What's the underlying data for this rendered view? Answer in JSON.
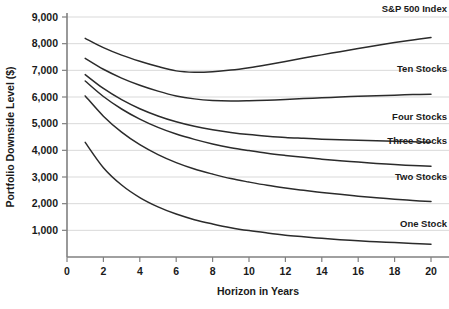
{
  "chart_data": {
    "type": "line",
    "title": "",
    "xlabel": "Horizon in Years",
    "ylabel": "Portfolio Downside Level ($)",
    "xlim": [
      0,
      20
    ],
    "ylim": [
      0,
      9000
    ],
    "grid": true,
    "legend_position": "inline-right",
    "x_ticks": [
      "0",
      "2",
      "4",
      "6",
      "8",
      "10",
      "12",
      "14",
      "16",
      "18",
      "20"
    ],
    "x_tick_values": [
      0,
      2,
      4,
      6,
      8,
      10,
      12,
      14,
      16,
      18,
      20
    ],
    "y_ticks": [
      "1,000",
      "2,000",
      "3,000",
      "4,000",
      "5,000",
      "6,000",
      "7,000",
      "8,000",
      "9,000"
    ],
    "y_tick_values": [
      1000,
      2000,
      3000,
      4000,
      5000,
      6000,
      7000,
      8000,
      9000
    ],
    "x": [
      1,
      2,
      3,
      4,
      5,
      6,
      7,
      8,
      9,
      10,
      11,
      12,
      13,
      14,
      15,
      16,
      17,
      18,
      19,
      20
    ],
    "series": [
      {
        "name": "S&P 500 Index",
        "label": "S&P 500 Index",
        "values": [
          8200,
          7850,
          7570,
          7340,
          7140,
          6980,
          6930,
          6950,
          7010,
          7100,
          7210,
          7330,
          7460,
          7580,
          7700,
          7820,
          7930,
          8040,
          8140,
          8230
        ]
      },
      {
        "name": "Ten Stocks",
        "label": "Ten Stocks",
        "values": [
          7450,
          7040,
          6710,
          6440,
          6220,
          6040,
          5930,
          5870,
          5850,
          5860,
          5880,
          5910,
          5940,
          5970,
          6000,
          6030,
          6050,
          6070,
          6090,
          6100
        ]
      },
      {
        "name": "Four Stocks",
        "label": "Four Stocks",
        "values": [
          6840,
          6320,
          5900,
          5560,
          5290,
          5070,
          4900,
          4770,
          4670,
          4590,
          4530,
          4480,
          4450,
          4420,
          4400,
          4380,
          4360,
          4340,
          4320,
          4300
        ]
      },
      {
        "name": "Three Stocks",
        "label": "Three Stocks",
        "values": [
          6600,
          6020,
          5550,
          5170,
          4860,
          4610,
          4410,
          4240,
          4100,
          3990,
          3890,
          3810,
          3740,
          3670,
          3610,
          3560,
          3510,
          3470,
          3430,
          3400
        ]
      },
      {
        "name": "Two Stocks",
        "label": "Two Stocks",
        "values": [
          6040,
          5280,
          4680,
          4210,
          3840,
          3540,
          3300,
          3110,
          2940,
          2810,
          2690,
          2590,
          2500,
          2420,
          2350,
          2280,
          2220,
          2170,
          2120,
          2080
        ]
      },
      {
        "name": "One Stock",
        "label": "One Stock",
        "values": [
          4300,
          3350,
          2700,
          2230,
          1880,
          1610,
          1400,
          1240,
          1100,
          990,
          900,
          820,
          760,
          700,
          650,
          610,
          570,
          540,
          510,
          480
        ]
      }
    ],
    "colors": {
      "line": "#2b2b2b",
      "grid": "#d9d9d9",
      "axis": "#808080",
      "text": "#1a1a1a",
      "background": "#ffffff"
    }
  }
}
